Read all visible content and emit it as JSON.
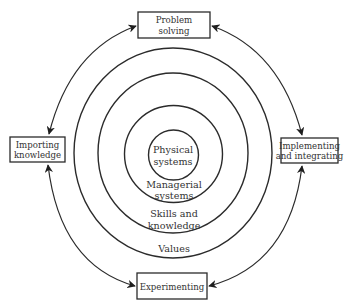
{
  "diagram": {
    "type": "concentric-cycle",
    "rings": [
      {
        "id": "physical",
        "lines": [
          "Physical",
          "systems"
        ]
      },
      {
        "id": "managerial",
        "lines": [
          "Managerial",
          "systems"
        ]
      },
      {
        "id": "skills",
        "lines": [
          "Skills and",
          "knowledge"
        ]
      },
      {
        "id": "values",
        "lines": [
          "Values"
        ]
      }
    ],
    "activities": [
      {
        "id": "problem-solving",
        "position": "top",
        "lines": [
          "Problem",
          "solving"
        ]
      },
      {
        "id": "implementing",
        "position": "right",
        "lines": [
          "Implementing",
          "and integrating"
        ]
      },
      {
        "id": "experimenting",
        "position": "bottom",
        "lines": [
          "Experimenting"
        ]
      },
      {
        "id": "importing",
        "position": "left",
        "lines": [
          "Importing",
          "knowledge"
        ]
      }
    ],
    "connections": [
      {
        "from": "problem-solving",
        "to": "importing",
        "bidirectional": true
      },
      {
        "from": "problem-solving",
        "to": "implementing",
        "bidirectional": true
      },
      {
        "from": "importing",
        "to": "experimenting",
        "bidirectional": true
      },
      {
        "from": "implementing",
        "to": "experimenting",
        "bidirectional": true
      }
    ]
  }
}
